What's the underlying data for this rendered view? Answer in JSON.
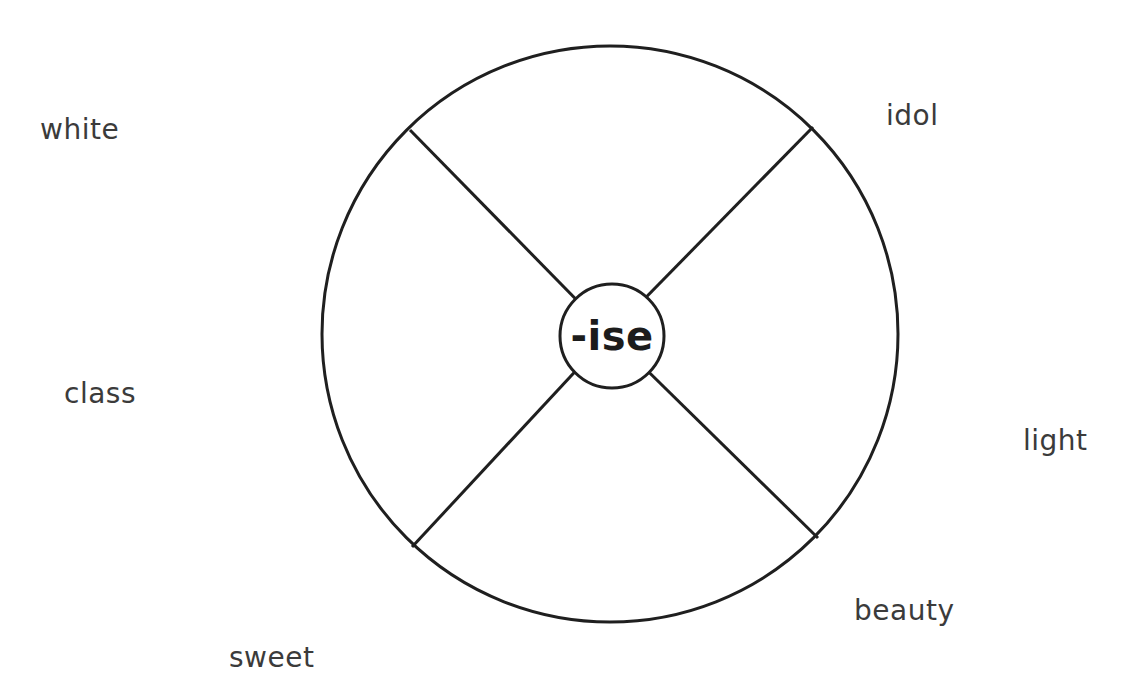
{
  "diagram": {
    "type": "word-wheel",
    "center_label": "-ise",
    "words": [
      "white",
      "idol",
      "class",
      "light",
      "beauty",
      "sweet"
    ],
    "colors": {
      "line": "#1f1f1f",
      "text": "#3b3b3b",
      "background": "#ffffff"
    }
  }
}
